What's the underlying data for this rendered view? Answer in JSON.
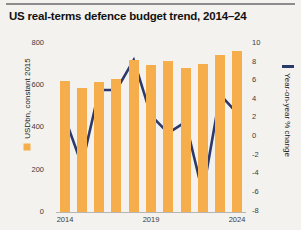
{
  "header": {
    "title": "US real-terms defence budget trend, 2014–24"
  },
  "legend": {
    "left_label": "USDbn, constant 2015",
    "right_label": "Year-on-year % change",
    "bar_color": "#f5ae4b",
    "line_color": "#2b3a6b"
  },
  "chart_data": {
    "type": "bar",
    "title": "US real-terms defence budget trend, 2014–24",
    "xlabel": "",
    "ylabel": "USDbn, constant 2015",
    "y2label": "Year-on-year % change",
    "categories": [
      "2014",
      "2015",
      "2016",
      "2017",
      "2018",
      "2019",
      "2020",
      "2021",
      "2022",
      "2023",
      "2024"
    ],
    "tick_labels_x": [
      "2014",
      "2019",
      "2024"
    ],
    "ylim": [
      0,
      800
    ],
    "yticks": [
      0,
      200,
      400,
      600,
      800
    ],
    "y2lim": [
      -8,
      10
    ],
    "y2ticks": [
      10,
      8,
      6,
      4,
      2,
      0,
      -2,
      -4,
      -6,
      -8
    ],
    "grid": false,
    "legend_position": "axis-titles",
    "series": [
      {
        "name": "USDbn, constant 2015",
        "type": "bar",
        "axis": "left",
        "color": "#f5ae4b",
        "values": [
          620,
          585,
          615,
          630,
          720,
          695,
          715,
          680,
          700,
          745,
          760
        ]
      },
      {
        "name": "Year-on-year % change",
        "type": "line",
        "axis": "right",
        "color": "#2b3a6b",
        "values": [
          2.1,
          -3.0,
          5.0,
          5.0,
          8.2,
          2.3,
          0.4,
          1.6,
          -6.0,
          4.5,
          2.5
        ]
      }
    ]
  }
}
